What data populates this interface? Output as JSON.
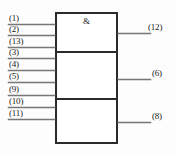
{
  "diagram": {
    "type": "logic-gate-symbol",
    "gate_glyph": "&",
    "colors": {
      "outline": "#2b2b2b",
      "wire": "#777777",
      "text": "#1a1a1a",
      "background": "#fdfdfd"
    },
    "inputs": [
      {
        "label": "(1)",
        "y": 24,
        "section": 1
      },
      {
        "label": "(2)",
        "y": 35,
        "section": 1
      },
      {
        "label": "(13)",
        "y": 47,
        "section": 1
      },
      {
        "label": "(3)",
        "y": 58,
        "section": 2
      },
      {
        "label": "(4)",
        "y": 70,
        "section": 2
      },
      {
        "label": "(5)",
        "y": 82,
        "section": 2
      },
      {
        "label": "(9)",
        "y": 95,
        "section": 3
      },
      {
        "label": "(10)",
        "y": 107,
        "section": 3
      },
      {
        "label": "(11)",
        "y": 119,
        "section": 3
      }
    ],
    "outputs": [
      {
        "label": "(12)",
        "y": 33,
        "section": 1
      },
      {
        "label": "(6)",
        "y": 79,
        "section": 2
      },
      {
        "label": "(8)",
        "y": 122,
        "section": 3
      }
    ],
    "sections": [
      {
        "index": 1,
        "top": 12,
        "bottom": 52
      },
      {
        "index": 2,
        "top": 52,
        "bottom": 99
      },
      {
        "index": 3,
        "top": 99,
        "bottom": 144
      }
    ]
  }
}
